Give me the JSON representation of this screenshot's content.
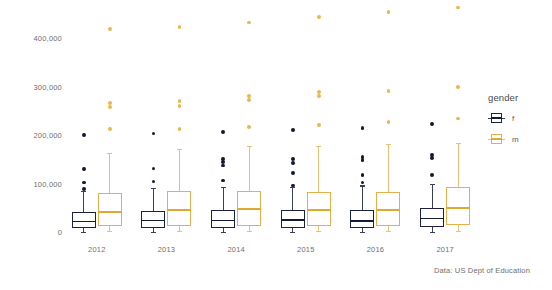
{
  "chart_data": {
    "type": "box",
    "title": "",
    "xlabel": "",
    "ylabel": "",
    "caption": "Data: US Dept of Education",
    "grid": false,
    "legend": {
      "title": "gender",
      "position": "right",
      "entries": [
        {
          "label": "f",
          "color": "#1c2340"
        },
        {
          "label": "m",
          "color": "#e3b04b"
        }
      ]
    },
    "yaxis": {
      "ticks": [
        0,
        100000,
        200000,
        300000,
        400000
      ],
      "tick_labels": [
        "0",
        "100,000",
        "200,000",
        "300,000",
        "400,000"
      ],
      "ylim": [
        0,
        470000
      ]
    },
    "xaxis": {
      "categories": [
        "2012",
        "2013",
        "2014",
        "2015",
        "2016",
        "2017"
      ]
    },
    "series": [
      {
        "name": "f",
        "color": "#1c2340",
        "boxes": [
          {
            "category": "2012",
            "whisker_low": 1000,
            "q1": 8000,
            "median": 22000,
            "q3": 42000,
            "whisker_high": 84000,
            "outliers": [
              88000,
              102000,
              130000,
              200000
            ]
          },
          {
            "category": "2013",
            "whisker_low": 1000,
            "q1": 9000,
            "median": 24000,
            "q3": 44000,
            "whisker_high": 91000,
            "outliers": [
              104000,
              131000,
              203000
            ]
          },
          {
            "category": "2014",
            "whisker_low": 1000,
            "q1": 9000,
            "median": 24000,
            "q3": 45000,
            "whisker_high": 92000,
            "outliers": [
              106000,
              137000,
              144000,
              150000,
              207000
            ]
          },
          {
            "category": "2015",
            "whisker_low": 1000,
            "q1": 9000,
            "median": 25000,
            "q3": 46000,
            "whisker_high": 92000,
            "outliers": [
              96000,
              122000,
              143000,
              150000,
              211000
            ]
          },
          {
            "category": "2016",
            "whisker_low": 1000,
            "q1": 9000,
            "median": 23000,
            "q3": 45000,
            "whisker_high": 96000,
            "outliers": [
              102000,
              117000,
              148000,
              155000,
              215000
            ]
          },
          {
            "category": "2017",
            "whisker_low": 1000,
            "q1": 10000,
            "median": 28000,
            "q3": 50000,
            "whisker_high": 100000,
            "outliers": [
              118000,
              152000,
              158000,
              223000
            ]
          }
        ]
      },
      {
        "name": "m",
        "color": "#e3b04b",
        "boxes": [
          {
            "category": "2012",
            "whisker_low": 3000,
            "q1": 13000,
            "median": 42000,
            "q3": 80000,
            "whisker_high": 163000,
            "outliers": [
              212000,
              257000,
              266000,
              418000
            ]
          },
          {
            "category": "2013",
            "whisker_low": 3000,
            "q1": 13000,
            "median": 46000,
            "q3": 85000,
            "whisker_high": 172000,
            "outliers": [
              213000,
              260000,
              270000,
              422000
            ]
          },
          {
            "category": "2014",
            "whisker_low": 3000,
            "q1": 13000,
            "median": 47000,
            "q3": 85000,
            "whisker_high": 177000,
            "outliers": [
              217000,
              272000,
              280000,
              432000
            ]
          },
          {
            "category": "2015",
            "whisker_low": 3000,
            "q1": 13000,
            "median": 46000,
            "q3": 83000,
            "whisker_high": 178000,
            "outliers": [
              221000,
              281000,
              288000,
              443000
            ]
          },
          {
            "category": "2016",
            "whisker_low": 3000,
            "q1": 13000,
            "median": 46000,
            "q3": 83000,
            "whisker_high": 181000,
            "outliers": [
              226000,
              291000,
              453000
            ]
          },
          {
            "category": "2017",
            "whisker_low": 3000,
            "q1": 14000,
            "median": 50000,
            "q3": 92000,
            "whisker_high": 183000,
            "outliers": [
              234000,
              299000,
              463000
            ]
          }
        ]
      }
    ]
  }
}
